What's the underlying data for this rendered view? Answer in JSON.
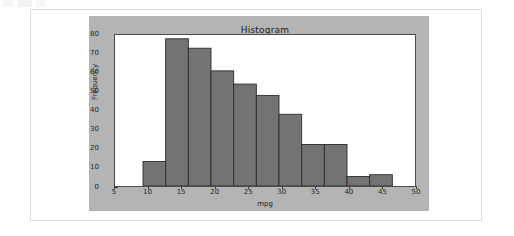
{
  "chart_data": {
    "type": "bar",
    "title": "Histogram",
    "xlabel": "mpg",
    "ylabel": "Frequency",
    "xlim": [
      5,
      50
    ],
    "ylim": [
      0,
      80
    ],
    "xticks": [
      5,
      10,
      15,
      20,
      25,
      30,
      35,
      40,
      45,
      50
    ],
    "yticks": [
      0,
      10,
      20,
      30,
      40,
      50,
      60,
      70,
      80
    ],
    "grid": false,
    "legend": null,
    "bar_color": "#737373",
    "bar_edge_color": "#2b2b2b",
    "bin_width": 3.4,
    "bin_edges": [
      9.2,
      12.6,
      16.0,
      19.4,
      22.8,
      26.2,
      29.6,
      33.0,
      36.4,
      39.8,
      43.2,
      46.6
    ],
    "bin_centers": [
      10.9,
      14.3,
      17.7,
      21.1,
      24.5,
      27.9,
      31.3,
      34.7,
      38.1,
      41.5,
      44.9
    ],
    "values": [
      13,
      78,
      73,
      61,
      54,
      48,
      38,
      22,
      5,
      6
    ],
    "bars": [
      {
        "left": 9.2,
        "right": 12.6,
        "value": 13
      },
      {
        "left": 12.6,
        "right": 16.0,
        "value": 78
      },
      {
        "left": 16.0,
        "right": 19.4,
        "value": 73
      },
      {
        "left": 19.4,
        "right": 22.8,
        "value": 61
      },
      {
        "left": 22.8,
        "right": 26.2,
        "value": 54
      },
      {
        "left": 26.2,
        "right": 29.6,
        "value": 48
      },
      {
        "left": 29.6,
        "right": 33.0,
        "value": 38
      },
      {
        "left": 33.0,
        "right": 36.4,
        "value": 22
      },
      {
        "left": 36.4,
        "right": 39.8,
        "value": 22
      },
      {
        "left": 39.8,
        "right": 43.2,
        "value": 5
      },
      {
        "left": 43.2,
        "right": 46.6,
        "value": 6
      }
    ]
  },
  "figure": {
    "panel_color": "#b4b4b4",
    "axes_background": "#ffffff",
    "spine_color": "#4a4a4a"
  },
  "card": {
    "background": "#ffffff",
    "border_color": "#dcdcdc"
  }
}
